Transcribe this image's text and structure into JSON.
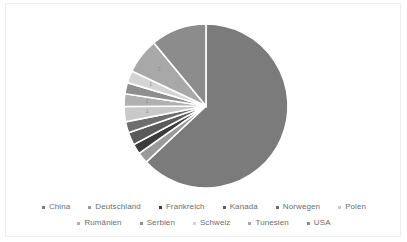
{
  "chart_data": {
    "type": "pie",
    "title": "",
    "legend_position": "bottom",
    "grid": false,
    "center": {
      "x": 200,
      "y": 102
    },
    "radius": 82,
    "start_angle_deg": -90,
    "categories": [
      "China",
      "Deutschland",
      "Frankreich",
      "Kanada",
      "Norwegen",
      "Polen",
      "Rumänien",
      "Serbien",
      "Schweiz",
      "Tunesien",
      "USA"
    ],
    "values": [
      63.0,
      2.2,
      2.0,
      2.5,
      2.2,
      3.0,
      2.5,
      2.2,
      2.4,
      7.0,
      11.0
    ],
    "colors": [
      "#7b7b7b",
      "#9a9a9a",
      "#3c3c3c",
      "#5a5a5a",
      "#6e6e6e",
      "#c9c9c9",
      "#b0b0b0",
      "#8e8e8e",
      "#d4d4d4",
      "#a8a8a8",
      "#8c8c8c"
    ],
    "slice_labels": [
      "",
      "",
      "",
      "",
      "",
      "1",
      "1",
      "",
      "1",
      "2",
      "2"
    ],
    "xlabel": "",
    "ylabel": ""
  },
  "legend": {
    "rows": [
      [
        {
          "label": "China",
          "color": "#7b7b7b"
        },
        {
          "label": "Deutschland",
          "color": "#9a9a9a"
        },
        {
          "label": "Frankreich",
          "color": "#3c3c3c"
        },
        {
          "label": "Kanada",
          "color": "#5a5a5a"
        },
        {
          "label": "Norwegen",
          "color": "#6e6e6e"
        },
        {
          "label": "Polen",
          "color": "#c9c9c9"
        }
      ],
      [
        {
          "label": "Rumänien",
          "color": "#b0b0b0"
        },
        {
          "label": "Serbien",
          "color": "#8e8e8e"
        },
        {
          "label": "Schweiz",
          "color": "#d4d4d4"
        },
        {
          "label": "Tunesien",
          "color": "#a8a8a8"
        },
        {
          "label": "USA",
          "color": "#8c8c8c"
        }
      ]
    ]
  }
}
